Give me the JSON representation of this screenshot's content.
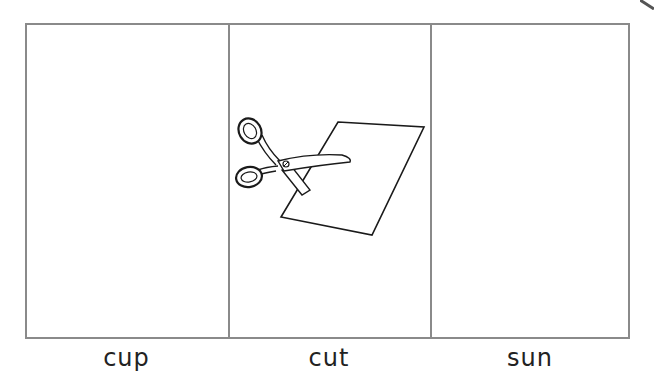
{
  "worksheet": {
    "cells": [
      {
        "word": "cup",
        "picture": null
      },
      {
        "word": "cut",
        "picture": "scissors-cutting-paper"
      },
      {
        "word": "sun",
        "picture": null
      }
    ]
  },
  "colors": {
    "border": "#8a8a8a",
    "line_art": "#1a1a1a",
    "text": "#222222"
  }
}
